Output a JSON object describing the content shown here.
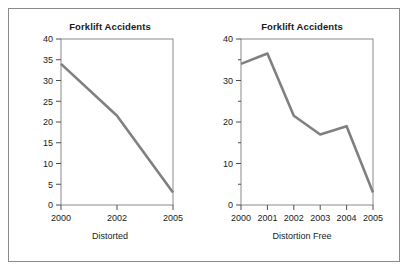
{
  "figure": {
    "background_color": "#ffffff",
    "frame_color": "#8a8a8a",
    "line_color": "#808080",
    "text_color": "#1a1a1a"
  },
  "panels": {
    "distorted": {
      "title": "Forklift Accidents",
      "caption": "Distorted",
      "y_ticks": [
        "0",
        "5",
        "10",
        "15",
        "20",
        "25",
        "30",
        "35",
        "40"
      ],
      "x_ticks": [
        "2000",
        "2002",
        "2005"
      ]
    },
    "free": {
      "title": "Forklift Accidents",
      "caption": "Distortion Free",
      "y_ticks": [
        "0",
        "10",
        "20",
        "30",
        "40"
      ],
      "x_ticks": [
        "2000",
        "2001",
        "2002",
        "2003",
        "2004",
        "2005"
      ]
    }
  },
  "chart_data": [
    {
      "type": "line",
      "title": "Forklift Accidents",
      "subtitle": "Distorted",
      "xlabel": "Distorted",
      "ylabel": "",
      "x": [
        "2000",
        "2002",
        "2005"
      ],
      "values": [
        34,
        21.5,
        3
      ],
      "ylim": [
        0,
        40
      ],
      "y_ticks": [
        0,
        5,
        10,
        15,
        20,
        25,
        30,
        35,
        40
      ],
      "x_axis_note": "Years 2000, 2002, 2005 are plotted at equal spacing, omitting 2001, 2003 and 2004 — this unequal time spacing distorts the trend.",
      "grid": false,
      "legend": "none",
      "line_color": "#808080"
    },
    {
      "type": "line",
      "title": "Forklift Accidents",
      "subtitle": "Distortion Free",
      "xlabel": "Distortion Free",
      "ylabel": "",
      "x": [
        "2000",
        "2001",
        "2002",
        "2003",
        "2004",
        "2005"
      ],
      "values": [
        34,
        36.5,
        21.5,
        17,
        19,
        3
      ],
      "ylim": [
        0,
        40
      ],
      "y_ticks": [
        0,
        10,
        20,
        30,
        40
      ],
      "y_minor_ticks": [
        5,
        15,
        25,
        35
      ],
      "grid": false,
      "legend": "none",
      "line_color": "#808080"
    }
  ]
}
